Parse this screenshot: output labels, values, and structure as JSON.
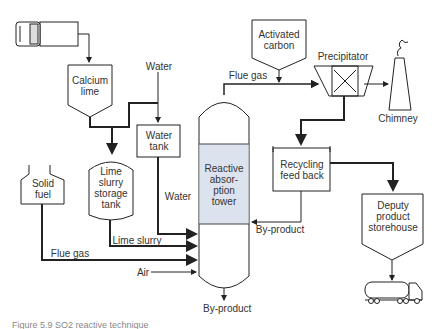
{
  "diagram": {
    "nodes": {
      "calcium_lime": "Calcium lime",
      "calcium_lime_l1": "Calcium",
      "calcium_lime_l2": "lime",
      "water_tank_l1": "Water",
      "water_tank_l2": "tank",
      "lime_slurry_l1": "Lime",
      "lime_slurry_l2": "slurry",
      "lime_slurry_l3": "storage",
      "lime_slurry_l4": "tank",
      "solid_fuel_l1": "Solid",
      "solid_fuel_l2": "fuel",
      "tower_l1": "Reactive",
      "tower_l2": "absor-",
      "tower_l3": "ption",
      "tower_l4": "tower",
      "activated_carbon_l1": "Activated",
      "activated_carbon_l2": "carbon",
      "precipitator": "Precipitator",
      "chimney": "Chimney",
      "recycling_l1": "Recycling",
      "recycling_l2": "feed back",
      "deputy_l1": "Deputy",
      "deputy_l2": "product",
      "deputy_l3": "storehouse"
    },
    "flows": {
      "water_in": "Water",
      "water_to_tower": "Water",
      "lime_slurry": "Lime slurry",
      "flue_gas_fuel": "Flue gas",
      "air": "Air",
      "flue_gas_top": "Flue gas",
      "byproduct_recycle": "By-product",
      "byproduct_bottom": "By-product"
    },
    "colors": {
      "tower_fill": "#dde3ee",
      "line": "#222222"
    }
  },
  "caption": "Figure 5.9  SO2 reactive technique"
}
